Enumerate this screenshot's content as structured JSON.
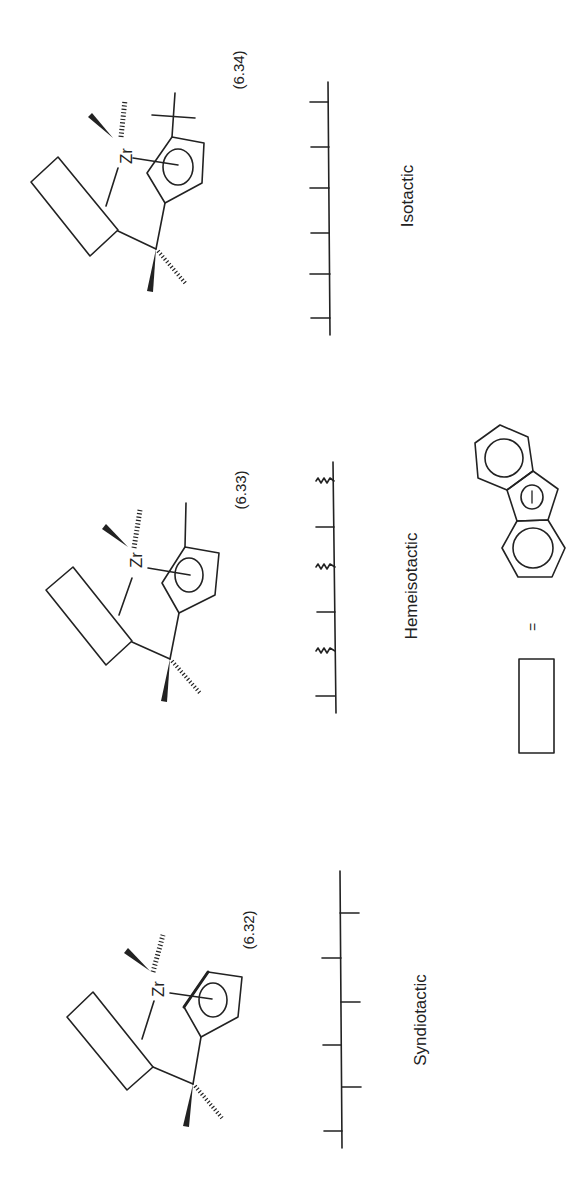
{
  "figure": {
    "orientation": "rotated-90-ccw",
    "panels": [
      {
        "id": "isotactic",
        "equation_number": "(6.34)",
        "metal": "Zr",
        "cp_substituent": "tert-butyl",
        "tacticity_label": "Isotactic",
        "chain_ticks": [
          "left",
          "left",
          "left",
          "left",
          "left",
          "left"
        ]
      },
      {
        "id": "hemeisotactic",
        "equation_number": "(6.33)",
        "metal": "Zr",
        "cp_substituent": "methyl",
        "tacticity_label": "Hemeisotactic",
        "chain_ticks": [
          "wavy",
          "left",
          "wavy",
          "left",
          "wavy",
          "left"
        ]
      },
      {
        "id": "syndiotactic",
        "equation_number": "(6.32)",
        "metal": "Zr",
        "cp_substituent": "none",
        "tacticity_label": "Syndiotactic",
        "chain_ticks": [
          "right",
          "left",
          "right",
          "left",
          "right",
          "left"
        ]
      }
    ],
    "legend": {
      "symbol": "rectangle",
      "equals": "=",
      "meaning": "fluorenyl anion",
      "charge": "−"
    }
  }
}
